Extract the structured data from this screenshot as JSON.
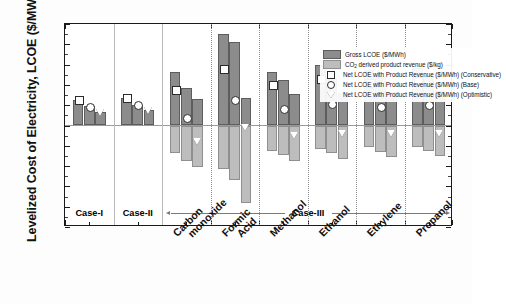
{
  "chart_data": {
    "type": "bar",
    "title": "",
    "xlabel": "",
    "ylabel": "Levelized Cost of Electricity, LCOE ($/MWh)",
    "ylim": [
      -250,
      250
    ],
    "ytick_step": 50,
    "yticks": [
      250,
      200,
      150,
      100,
      50,
      0,
      -50,
      -100,
      -150,
      -200,
      -250
    ],
    "grid": false,
    "legend_position": "top-right",
    "categories": [
      "Case-I",
      "Case-I",
      "Case-I",
      "Case-II",
      "Case-II",
      "Case-II",
      "Carbon monoxide",
      "Carbon monoxide",
      "Carbon monoxide",
      "Formic Acid",
      "Formic Acid",
      "Formic Acid",
      "Methanol",
      "Methanol",
      "Methanol",
      "Ethanol",
      "Ethanol",
      "Ethanol",
      "Ethylene",
      "Ethylene",
      "Ethylene",
      "Propanol",
      "Propanol",
      "Propanol"
    ],
    "series": [
      {
        "name": "Gross LCOE ($/MWh)",
        "values": [
          63,
          47,
          33,
          68,
          51,
          38,
          133,
          92,
          65,
          225,
          205,
          68,
          133,
          112,
          78,
          148,
          118,
          80,
          137,
          120,
          82,
          142,
          122,
          84
        ]
      },
      {
        "name": "CO2 derived product revenue ($/kg)",
        "values": [
          0,
          0,
          0,
          0,
          0,
          0,
          -68,
          -88,
          -103,
          -108,
          -135,
          -190,
          -62,
          -73,
          -88,
          -58,
          -68,
          -82,
          -54,
          -66,
          -78,
          -52,
          -64,
          -76
        ]
      },
      {
        "name": "Net LCOE with Product Revenue ($/MWh) (Conservative)",
        "values": [
          63,
          null,
          null,
          68,
          null,
          null,
          88,
          null,
          null,
          140,
          null,
          null,
          100,
          null,
          null,
          115,
          null,
          null,
          105,
          null,
          null,
          110,
          null,
          null
        ]
      },
      {
        "name": "Net LCOE with Product Revenue ($/MWh) (Base)",
        "values": [
          null,
          48,
          null,
          null,
          51,
          null,
          null,
          20,
          null,
          null,
          63,
          null,
          null,
          43,
          null,
          null,
          53,
          null,
          null,
          48,
          null,
          null,
          52,
          null
        ]
      },
      {
        "name": "Net LCOE with Product Revenue ($/MWh) (Optimistic)",
        "values": [
          null,
          null,
          33,
          null,
          null,
          37,
          null,
          null,
          -38,
          null,
          null,
          -3,
          null,
          null,
          -24,
          null,
          null,
          -18,
          null,
          null,
          -18,
          null,
          null,
          -18
        ]
      }
    ]
  },
  "legend": {
    "items": [
      {
        "id": "gross",
        "swatch": "gross-swatch",
        "label": "Gross LCOE ($/MWh)"
      },
      {
        "id": "revenue",
        "swatch": "revenue-swatch",
        "label_pre": "CO",
        "label_sub": "2",
        "label_post": " derived product revenue ($/kg)"
      },
      {
        "id": "conservative",
        "swatch": "square-marker",
        "label": "Net LCOE with Product Revenue ($/MWh) (Conservative)"
      },
      {
        "id": "base",
        "swatch": "circle-marker",
        "label": "Net LCOE with Product Revenue ($/MWh) (Base)"
      },
      {
        "id": "optimistic",
        "swatch": "triangle-marker",
        "label": "Net LCOE with Product Revenue ($/MWh) (Optimistic)"
      }
    ]
  },
  "axis": {
    "ylabel": "Levelized Cost of Electricity, LCOE ($/MWh)",
    "ytick_labels": [
      "250",
      "200",
      "150",
      "100",
      "50",
      "0",
      "-50",
      "-100",
      "-150",
      "-200",
      "-250"
    ]
  },
  "cases": [
    {
      "id": "case-1",
      "label": "Case-I"
    },
    {
      "id": "case-2",
      "label": "Case-II"
    },
    {
      "id": "case-3",
      "label": "Case-III"
    }
  ],
  "xcategories": [
    {
      "id": "carbon-monoxide",
      "line1": "Carbon",
      "line2": "monoxide"
    },
    {
      "id": "formic-acid",
      "line1": "Formic",
      "line2": "Acid"
    },
    {
      "id": "methanol",
      "line1": "Methanol",
      "line2": ""
    },
    {
      "id": "ethanol",
      "line1": "Ethanol",
      "line2": ""
    },
    {
      "id": "ethylene",
      "line1": "Ethylene",
      "line2": ""
    },
    {
      "id": "propanol",
      "line1": "Propanol",
      "line2": ""
    }
  ],
  "colors": {
    "gross": "#8c8c8c",
    "revenue": "#bdbdbd",
    "axis": "#1a1a1a",
    "marker_fill": "#ffffff"
  }
}
